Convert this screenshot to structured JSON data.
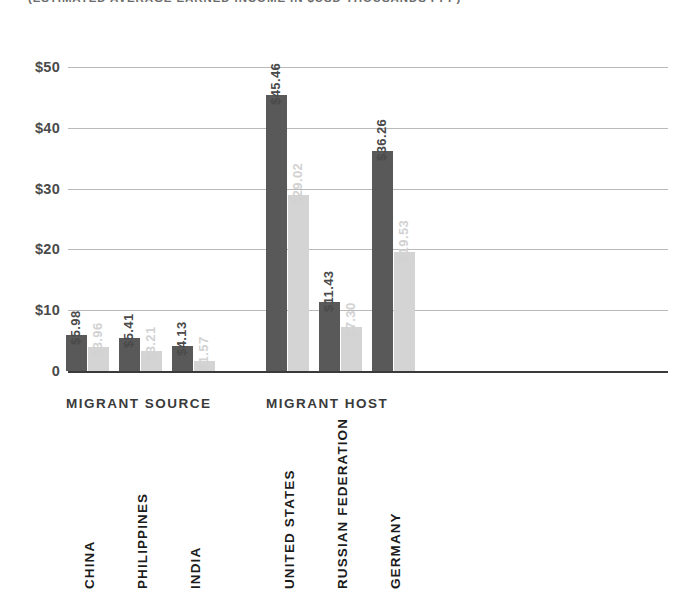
{
  "subtitle": "(ESTIMATED AVERAGE EARNED INCOME IN $USD THOUSANDS PPP)",
  "groups": {
    "source_label": "MIGRANT SOURCE",
    "host_label": "MIGRANT HOST"
  },
  "axis": {
    "ticks": [
      "$50",
      "$40",
      "$30",
      "$20",
      "$10",
      "0"
    ]
  },
  "colors": {
    "series_dark": "#595959",
    "series_light": "#d4d4d4",
    "gridline": "#b9b9b9",
    "axis": "#3a3a3a",
    "label_dark": "#4a4a4a",
    "label_light": "#d2d2d2"
  },
  "bars": [
    {
      "country": "CHINA",
      "group": "MIGRANT SOURCE",
      "dark_label": "$5.98",
      "light_label": "$3.96",
      "dark_value": 5.98,
      "light_value": 3.96
    },
    {
      "country": "PHILIPPINES",
      "group": "MIGRANT SOURCE",
      "dark_label": "$5.41",
      "light_label": "$3.21",
      "dark_value": 5.41,
      "light_value": 3.21
    },
    {
      "country": "INDIA",
      "group": "MIGRANT SOURCE",
      "dark_label": "$4.13",
      "light_label": "$1.57",
      "dark_value": 4.13,
      "light_value": 1.57
    },
    {
      "country": "UNITED STATES",
      "group": "MIGRANT HOST",
      "dark_label": "$45.46",
      "light_label": "$29.02",
      "dark_value": 45.46,
      "light_value": 29.02
    },
    {
      "country": "RUSSIAN FEDERATION",
      "group": "MIGRANT HOST",
      "dark_label": "$11.43",
      "light_label": "$7.30",
      "dark_value": 11.43,
      "light_value": 7.3
    },
    {
      "country": "GERMANY",
      "group": "MIGRANT HOST",
      "dark_label": "$36.26",
      "light_label": "$19.53",
      "dark_value": 36.26,
      "light_value": 19.53
    }
  ],
  "chart_data": {
    "type": "bar",
    "title": "",
    "subtitle": "(ESTIMATED AVERAGE EARNED INCOME IN $USD THOUSANDS PPP)",
    "xlabel": "",
    "ylabel": "",
    "ylim": [
      0,
      50
    ],
    "yticks": [
      0,
      10,
      20,
      30,
      40,
      50
    ],
    "ytick_labels": [
      "0",
      "$10",
      "$20",
      "$30",
      "$40",
      "$50"
    ],
    "grid": "horizontal",
    "legend": "none",
    "categories": [
      "CHINA",
      "PHILIPPINES",
      "INDIA",
      "UNITED STATES",
      "RUSSIAN FEDERATION",
      "GERMANY"
    ],
    "category_groups": [
      "MIGRANT SOURCE",
      "MIGRANT SOURCE",
      "MIGRANT SOURCE",
      "MIGRANT HOST",
      "MIGRANT HOST",
      "MIGRANT HOST"
    ],
    "series": [
      {
        "name": "series-dark",
        "color": "#595959",
        "values": [
          5.98,
          5.41,
          4.13,
          45.46,
          11.43,
          36.26
        ]
      },
      {
        "name": "series-light",
        "color": "#d4d4d4",
        "values": [
          3.96,
          3.21,
          1.57,
          29.02,
          7.3,
          19.53
        ]
      }
    ],
    "data_labels": [
      [
        "$5.98",
        "$3.96"
      ],
      [
        "$5.41",
        "$3.21"
      ],
      [
        "$4.13",
        "$1.57"
      ],
      [
        "$45.46",
        "$29.02"
      ],
      [
        "$11.43",
        "$7.30"
      ],
      [
        "$36.26",
        "$19.53"
      ]
    ]
  }
}
